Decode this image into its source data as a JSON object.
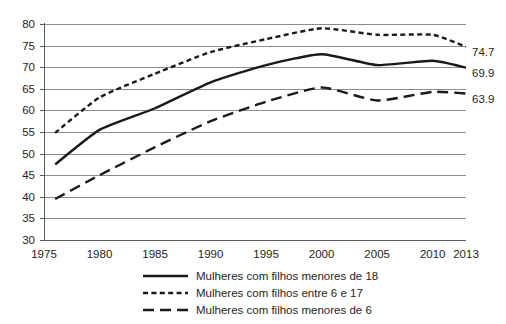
{
  "chart_data": {
    "type": "line",
    "title": "",
    "subtitle": "",
    "xlabel": "",
    "ylabel": "",
    "x": [
      1975,
      1980,
      1985,
      1990,
      1995,
      2000,
      2005,
      2010,
      2013
    ],
    "categories": [
      "1975",
      "1980",
      "1985",
      "1990",
      "1995",
      "2000",
      "2005",
      "2010",
      "2013"
    ],
    "xlim": [
      1975,
      2013
    ],
    "ylim": [
      30,
      80
    ],
    "y_ticks": [
      30,
      35,
      40,
      45,
      50,
      55,
      60,
      65,
      70,
      75,
      80
    ],
    "y_tick_labels": [
      "30",
      "35",
      "40",
      "45",
      "50",
      "55",
      "60",
      "65",
      "70",
      "75",
      "80"
    ],
    "x_tick_labels": [
      "1975",
      "1980",
      "1985",
      "1990",
      "1995",
      "2000",
      "2005",
      "2010",
      "2013"
    ],
    "grid": "horizontal",
    "legend_position": "bottom",
    "series": [
      {
        "name": "Mulheres com filhos menores de 18",
        "style": "solid",
        "color": "#1a1a1a",
        "x": [
          1976,
          1980,
          1985,
          1990,
          1995,
          2000,
          2005,
          2010,
          2013
        ],
        "values": [
          47.5,
          55.5,
          60.5,
          66.5,
          70.5,
          73.0,
          70.5,
          71.5,
          69.9
        ],
        "end_label": "69.9"
      },
      {
        "name": "Mulheres com filhos entre 6 e 17",
        "style": "dotted",
        "color": "#1a1a1a",
        "x": [
          1976,
          1980,
          1985,
          1990,
          1995,
          2000,
          2005,
          2010,
          2013
        ],
        "values": [
          54.8,
          63.0,
          68.5,
          73.5,
          76.5,
          79.0,
          77.5,
          77.5,
          74.7
        ],
        "end_label": "74.7"
      },
      {
        "name": "Mulheres com filhos menores de 6",
        "style": "dashed",
        "color": "#1a1a1a",
        "x": [
          1976,
          1980,
          1985,
          1990,
          1995,
          2000,
          2005,
          2010,
          2013
        ],
        "values": [
          39.5,
          45.0,
          51.5,
          57.5,
          62.0,
          65.3,
          62.3,
          64.3,
          63.9
        ],
        "end_label": "63.9"
      }
    ],
    "end_labels": [
      "74.7",
      "69.9",
      "63.9"
    ],
    "legend": [
      "Mulheres com filhos menores de 18",
      "Mulheres com filhos entre 6 e 17",
      "Mulheres com filhos menores de 6"
    ],
    "colors": {
      "series": "#1a1a1a",
      "grid": "#8c8c8c",
      "axis": "#5a5a5a",
      "text": "#231f20",
      "background": "#ffffff"
    }
  }
}
